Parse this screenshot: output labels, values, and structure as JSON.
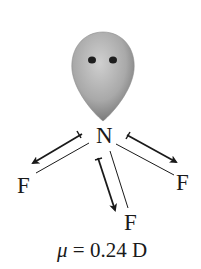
{
  "diagram": {
    "central_atom": "N",
    "lone_pair": {
      "label": "lone-pair-lobe",
      "fill_light": "#c8c8c8",
      "fill_dark": "#7a7a7a",
      "electron_color": "#1e1e1e"
    },
    "substituents": [
      {
        "label": "F",
        "position": "left"
      },
      {
        "label": "F",
        "position": "bottom"
      },
      {
        "label": "F",
        "position": "right"
      }
    ],
    "bond_dipole_arrows": [
      {
        "from": "N",
        "to": "F",
        "position": "left"
      },
      {
        "from": "N",
        "to": "F",
        "position": "bottom"
      },
      {
        "from": "N",
        "to": "F",
        "position": "right"
      }
    ],
    "caption": {
      "symbol": "μ",
      "equals": " = 0.24 D",
      "value": "0.24",
      "unit": "D"
    },
    "colors": {
      "ink": "#1a1a1a",
      "background": "#ffffff"
    }
  }
}
